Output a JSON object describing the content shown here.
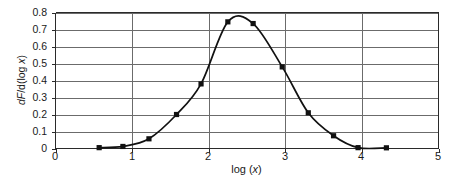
{
  "chart_data": {
    "type": "line",
    "title": "",
    "subtitle": "",
    "xlabel": "log (x)",
    "ylabel": "dF/d(log x)",
    "xlim": [
      0,
      5
    ],
    "ylim": [
      0,
      0.8
    ],
    "xticks": [
      "0",
      "1",
      "2",
      "3",
      "4",
      "5"
    ],
    "xtick_values": [
      0,
      1,
      2,
      3,
      4,
      5
    ],
    "yticks": [
      "0",
      "0.1",
      "0.2",
      "0.3",
      "0.4",
      "0.5",
      "0.6",
      "0.7",
      "0.8"
    ],
    "ytick_values": [
      0,
      0.1,
      0.2,
      0.3,
      0.4,
      0.5,
      0.6,
      0.7,
      0.8
    ],
    "grid": "horizontal-and-vertical",
    "legend": "none",
    "series": [
      {
        "name": "dF/d(log x)",
        "marker": "filled-square",
        "color": "#111111",
        "x": [
          0.57,
          0.88,
          1.22,
          1.58,
          1.9,
          2.25,
          2.58,
          2.96,
          3.3,
          3.63,
          3.95,
          4.32
        ],
        "y": [
          0.005,
          0.012,
          0.057,
          0.2,
          0.38,
          0.745,
          0.735,
          0.48,
          0.21,
          0.075,
          0.005,
          0.004
        ]
      }
    ],
    "peak": {
      "x": 2.42,
      "y": 0.78
    }
  },
  "axes": {
    "y_title_prefix": "d",
    "y_title_F": "F",
    "y_title_rest": "/d(log ",
    "y_title_x": "x",
    "y_title_close": ")",
    "x_title_prefix": "log (",
    "x_title_x": "x",
    "x_title_close": ")"
  }
}
